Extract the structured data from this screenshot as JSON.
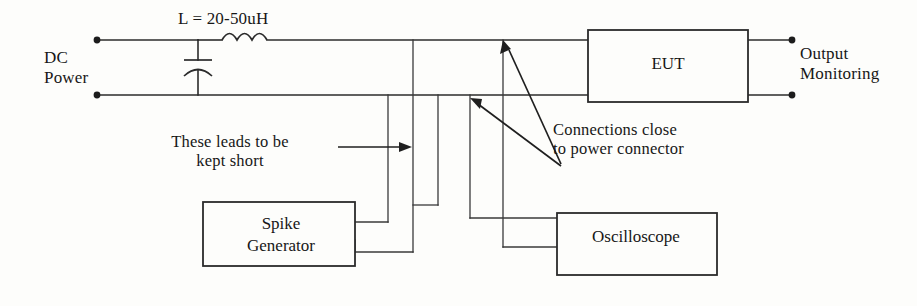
{
  "diagram": {
    "labels": {
      "inductor_value": "L = 20-50uH",
      "source_line1": "DC",
      "source_line2": "Power",
      "output_line1": "Output",
      "output_line2": "Monitoring",
      "note_leads_line1": "These leads to be",
      "note_leads_line2": "kept short",
      "note_connections_line1": "Connections close",
      "note_connections_line2": "to power connector"
    },
    "boxes": [
      {
        "id": "eut",
        "label": "EUT"
      },
      {
        "id": "spike-generator",
        "label_line1": "Spike",
        "label_line2": "Generator"
      },
      {
        "id": "oscilloscope",
        "label": "Oscilloscope"
      }
    ],
    "components": [
      {
        "id": "capacitor",
        "name": "capacitor-symbol"
      },
      {
        "id": "inductor",
        "name": "inductor-coil-symbol"
      }
    ],
    "terminals": [
      {
        "id": "dc-positive",
        "name": "terminal-dot"
      },
      {
        "id": "dc-negative",
        "name": "terminal-dot"
      },
      {
        "id": "out-positive",
        "name": "terminal-dot"
      },
      {
        "id": "out-negative",
        "name": "terminal-dot"
      }
    ],
    "colors": {
      "ink": "#2b2b2b",
      "background": "#fdfdfb",
      "text": "#171717"
    }
  }
}
